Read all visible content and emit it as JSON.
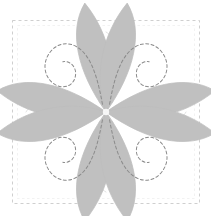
{
  "figure": {
    "name": "quilt-block-four-petal-diagram",
    "background_color": "#ffffff",
    "width": 211,
    "height": 216
  },
  "canvas": {
    "block": {
      "name": "block-border",
      "x": 12,
      "y": 20,
      "width": 188,
      "height": 184,
      "stroke_color": "#c9c9c9",
      "stroke_width": 0.9,
      "dash": "3 3",
      "fill": "#ffffff"
    },
    "center": {
      "x": 106,
      "y": 112
    }
  },
  "petals": {
    "fill_color": "#c0c0c0",
    "edge_color": "#bdbdbd",
    "count": 4,
    "items": [
      {
        "label": "petal-top-left",
        "rotation": -45,
        "tip_x": 22,
        "tip_y": 30
      },
      {
        "label": "petal-top-right",
        "rotation": 45,
        "tip_x": 190,
        "tip_y": 30
      },
      {
        "label": "petal-bottom-left",
        "rotation": -135,
        "tip_x": 22,
        "tip_y": 194
      },
      {
        "label": "petal-bottom-right",
        "rotation": 135,
        "tip_x": 190,
        "tip_y": 194
      }
    ]
  },
  "stitching": {
    "name": "quilting-stitch-lines",
    "color": "#8a8a8a",
    "stroke_width": 1.0,
    "dash": "3 2.4",
    "description": "Curled teardrop stitch motif inside each petal"
  },
  "motifs": {
    "name": "background-quilting-motifs",
    "color": "#dedede",
    "stroke_width": 0.9,
    "dash": "3 2.6",
    "items": [
      {
        "label": "motif-top",
        "cx": 106,
        "cy": 48,
        "r": 17
      },
      {
        "label": "motif-bottom",
        "cx": 106,
        "cy": 176,
        "r": 17
      },
      {
        "label": "motif-left",
        "cx": 42,
        "cy": 112,
        "r": 17
      },
      {
        "label": "motif-right",
        "cx": 170,
        "cy": 112,
        "r": 17
      }
    ]
  },
  "chart_data": {
    "type": "diagram",
    "elements": [
      "dashed-square-border",
      "four-gray-petals",
      "dashed-quilting-stitches",
      "corner-background-motifs"
    ],
    "palette": {
      "petal": "#c0c0c0",
      "stitch": "#8a8a8a",
      "border": "#c9c9c9",
      "motif": "#dedede",
      "background": "#ffffff"
    }
  }
}
